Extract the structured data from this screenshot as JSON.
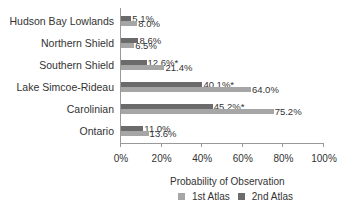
{
  "chart_data": {
    "type": "bar",
    "orientation": "horizontal",
    "title": "",
    "xlabel": "Probability of Observation",
    "ylabel": "",
    "xlim": [
      0,
      100
    ],
    "x_ticks": [
      "0%",
      "20%",
      "40%",
      "60%",
      "80%",
      "100%"
    ],
    "categories": [
      "Hudson Bay Lowlands",
      "Northern Shield",
      "Southern Shield",
      "Lake Simcoe-Rideau",
      "Carolinian",
      "Ontario"
    ],
    "series": [
      {
        "name": "2nd Atlas",
        "color": "#6b6b6b",
        "values": [
          5.1,
          8.6,
          12.6,
          40.1,
          45.2,
          11.0
        ],
        "labels": [
          "5.1%",
          "8.6%",
          "12.6%*",
          "40.1%*",
          "45.2%*",
          "11.0%"
        ]
      },
      {
        "name": "1st Atlas",
        "color": "#a6a6a6",
        "values": [
          8.0,
          6.5,
          21.4,
          64.0,
          75.2,
          13.6
        ],
        "labels": [
          "8.0%",
          "6.5%",
          "21.4%",
          "64.0%",
          "75.2%",
          "13.6%"
        ]
      }
    ],
    "legend": [
      "1st Atlas",
      "2nd Atlas"
    ],
    "legend_position": "bottom",
    "grid": false
  }
}
